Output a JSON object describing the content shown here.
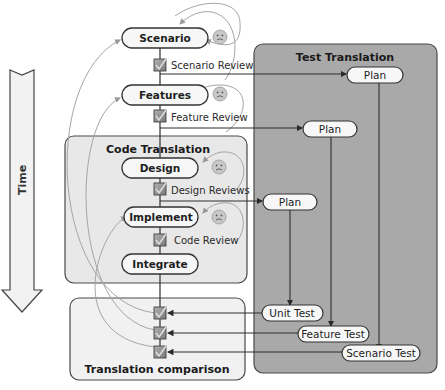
{
  "time_arrow": {
    "label": "Time"
  },
  "left_column": {
    "stages": [
      {
        "id": "scenario",
        "label": "Scenario",
        "review": "Scenario Review"
      },
      {
        "id": "features",
        "label": "Features",
        "review": "Feature Review"
      }
    ]
  },
  "code_translation": {
    "title": "Code Translation",
    "stages": [
      {
        "id": "design",
        "label": "Design",
        "review": "Design Reviews"
      },
      {
        "id": "implement",
        "label": "Implement",
        "review": "Code Review"
      },
      {
        "id": "integrate",
        "label": "Integrate"
      }
    ]
  },
  "test_translation": {
    "title": "Test Translation",
    "plans": [
      {
        "id": "plan-scenario",
        "label": "Plan"
      },
      {
        "id": "plan-feature",
        "label": "Plan"
      },
      {
        "id": "plan-unit",
        "label": "Plan"
      }
    ],
    "tests": [
      {
        "id": "unit-test",
        "label": "Unit Test"
      },
      {
        "id": "feature-test",
        "label": "Feature Test"
      },
      {
        "id": "scenario-test",
        "label": "Scenario Test"
      }
    ]
  },
  "translation_comparison": {
    "title": "Translation comparison"
  },
  "icons": {
    "review_check": "checkbox-check-icon",
    "feedback": "sad-face-icon"
  },
  "colors": {
    "test_panel_fill": "#a9a9a9",
    "code_panel_fill": "#e8e8e8",
    "comparison_panel_fill": "#f1f1f1",
    "pill_fill": "#f7f7f7",
    "stroke": "#3a3a3a",
    "feedback_arc": "#9a9a9a",
    "check_fill": "#8c8c8c"
  }
}
